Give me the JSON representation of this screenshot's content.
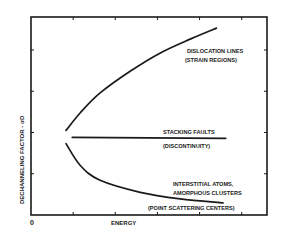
{
  "chart_data": {
    "type": "line",
    "title": "",
    "xlabel": "ENERGY",
    "ylabel": "DECHANNELING FACTOR - σD",
    "x_origin_label": "0",
    "xlim": [
      0,
      5.6
    ],
    "ylim": [
      0,
      4.8
    ],
    "x_ticks": [
      1,
      2,
      3,
      4,
      5
    ],
    "y_ticks": [
      1,
      2,
      3,
      4
    ],
    "tick_labels_shown": false,
    "grid": false,
    "legend": "none (inline labels)",
    "series": [
      {
        "name": "Dislocation lines",
        "label_lines": [
          "DISLOCATION LINES",
          "(STRAIN REGIONS)"
        ],
        "x": [
          0.83,
          1.17,
          1.64,
          2.36,
          3.07,
          3.79,
          4.4
        ],
        "y": [
          2.05,
          2.48,
          2.96,
          3.49,
          3.93,
          4.27,
          4.53
        ]
      },
      {
        "name": "Stacking faults",
        "label_lines": [
          "STACKING FAULTS",
          "(DISCONTINUITY)"
        ],
        "x": [
          0.98,
          4.62
        ],
        "y": [
          1.88,
          1.86
        ]
      },
      {
        "name": "Interstitial atoms, amorphous clusters",
        "label_lines": [
          "INTERSTITIAL ATOMS,",
          "AMORPHOUS CLUSTERS",
          "(POINT SCATTERING CENTERS)"
        ],
        "x": [
          0.83,
          1.17,
          1.64,
          2.59,
          3.54,
          4.56
        ],
        "y": [
          1.73,
          1.2,
          0.84,
          0.55,
          0.39,
          0.29
        ]
      }
    ]
  },
  "colors": {
    "ink": "#1a1a1a",
    "background": "#ffffff"
  }
}
